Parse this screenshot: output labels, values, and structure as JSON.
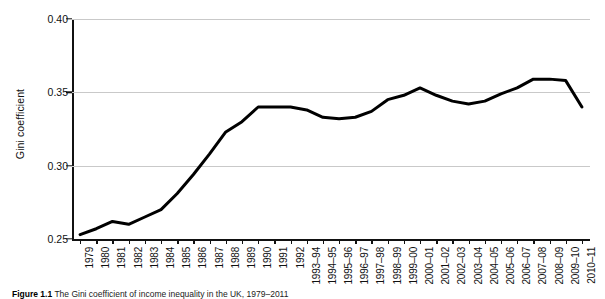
{
  "figure": {
    "caption_prefix": "Figure 1.1",
    "caption_text": "The Gini coefficient of income inequality in the UK, 1979–2011"
  },
  "chart_data": {
    "type": "line",
    "title": "",
    "xlabel": "",
    "ylabel": "Gini coefficient",
    "ylim": [
      0.25,
      0.4
    ],
    "yticks": [
      "0.25",
      "0.30",
      "0.35",
      "0.40"
    ],
    "ytick_values": [
      0.25,
      0.3,
      0.35,
      0.4
    ],
    "grid": true,
    "legend": "none",
    "line_color": "#000000",
    "line_width": 3,
    "categories": [
      "1979",
      "1980",
      "1981",
      "1982",
      "1983",
      "1984",
      "1985",
      "1986",
      "1987",
      "1988",
      "1989",
      "1990",
      "1991",
      "1992",
      "1993–94",
      "1994–95",
      "1995–96",
      "1996–97",
      "1997–98",
      "1998–99",
      "1999–00",
      "2000–01",
      "2001–02",
      "2002–03",
      "2003–04",
      "2004–05",
      "2005–06",
      "2006–07",
      "2007–08",
      "2008–09",
      "2009–10",
      "2010–11"
    ],
    "values": [
      0.253,
      0.257,
      0.262,
      0.26,
      0.265,
      0.27,
      0.281,
      0.294,
      0.308,
      0.323,
      0.33,
      0.34,
      0.34,
      0.34,
      0.338,
      0.333,
      0.332,
      0.333,
      0.337,
      0.345,
      0.348,
      0.353,
      0.348,
      0.344,
      0.342,
      0.344,
      0.349,
      0.353,
      0.359,
      0.359,
      0.358,
      0.34
    ],
    "series": [
      {
        "name": "Gini coefficient",
        "values": [
          0.253,
          0.257,
          0.262,
          0.26,
          0.265,
          0.27,
          0.281,
          0.294,
          0.308,
          0.323,
          0.33,
          0.34,
          0.34,
          0.34,
          0.338,
          0.333,
          0.332,
          0.333,
          0.337,
          0.345,
          0.348,
          0.353,
          0.348,
          0.344,
          0.342,
          0.344,
          0.349,
          0.353,
          0.359,
          0.359,
          0.358,
          0.34
        ]
      }
    ]
  }
}
